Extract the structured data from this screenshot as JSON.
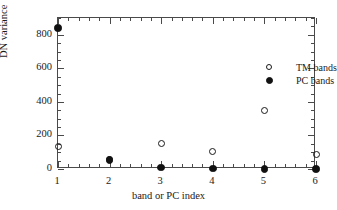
{
  "chart_data": {
    "type": "scatter",
    "title": "",
    "subtitle": "",
    "xlabel": "band or PC index",
    "ylabel": "DN variance",
    "x": [
      1,
      2,
      3,
      4,
      5,
      6
    ],
    "xlim": [
      1,
      6
    ],
    "ylim": [
      0,
      900
    ],
    "xticks": [
      "1",
      "2",
      "3",
      "4",
      "5",
      "6"
    ],
    "yticks": [
      "0",
      "200",
      "400",
      "600",
      "800"
    ],
    "ytick_values": [
      0,
      200,
      400,
      600,
      800
    ],
    "grid": false,
    "legend_position": "upper-right-inside",
    "minor_ticks": true,
    "frame": "box",
    "series": [
      {
        "name": "TM bands",
        "marker": "open-circle",
        "color": "#1a1a1a",
        "values": [
          135,
          58,
          150,
          105,
          350,
          85
        ]
      },
      {
        "name": "PC bands",
        "marker": "filled-circle",
        "color": "#111111",
        "values": [
          840,
          55,
          10,
          3,
          0,
          0
        ]
      }
    ]
  },
  "legend": {
    "items": [
      {
        "label": "TM bands",
        "marker": "open-circle"
      },
      {
        "label": "PC bands",
        "marker": "filled-circle"
      }
    ]
  },
  "axes": {
    "y_title": "DN variance",
    "x_title": "band or PC index",
    "y_tick_labels": [
      "800",
      "600",
      "400",
      "200",
      "0"
    ],
    "x_tick_labels": [
      "1",
      "2",
      "3",
      "4",
      "5",
      "6"
    ]
  }
}
